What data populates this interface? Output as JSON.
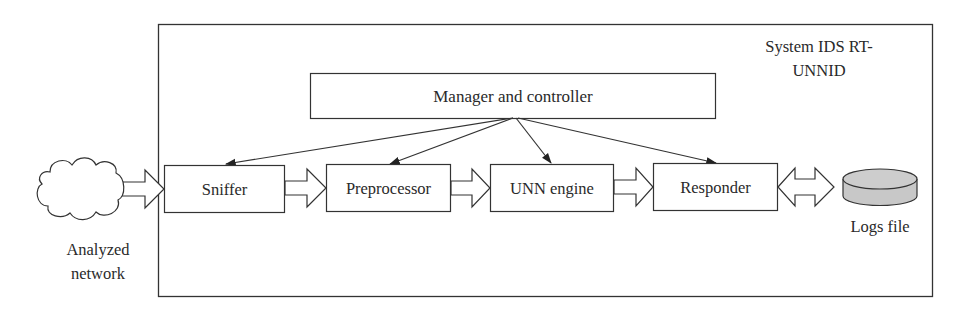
{
  "system": {
    "title_line1": "System IDS RT-",
    "title_line2": "UNNID"
  },
  "manager": {
    "label": "Manager and controller"
  },
  "pipeline": [
    {
      "id": "sniffer",
      "label": "Sniffer"
    },
    {
      "id": "preprocessor",
      "label": "Preprocessor"
    },
    {
      "id": "unn-engine",
      "label": "UNN engine"
    },
    {
      "id": "responder",
      "label": "Responder"
    }
  ],
  "network": {
    "icon": "cloud-icon",
    "label_line1": "Analyzed",
    "label_line2": "network"
  },
  "logs": {
    "icon": "database-cylinder-icon",
    "label": "Logs file",
    "fill_color": "#c8c8c8"
  },
  "colors": {
    "stroke": "#333333",
    "background": "#ffffff"
  }
}
